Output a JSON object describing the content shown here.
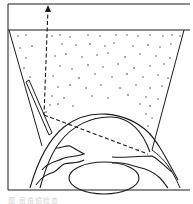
{
  "figure": {
    "colors": {
      "line": "#1a1a1a",
      "dots": "#333333",
      "background": "#ffffff",
      "caption": "#d6d6d6"
    },
    "elements": {
      "lens_top_rect": "top flat surface of goniolens",
      "lens_body": "trapezoidal lens body filled with stipple",
      "mirror": "angled mirror strip on left inner wall",
      "light_path": "dashed ray with arrowhead pointing up",
      "cornea": "curved cornea",
      "iris": "iris with pupil opening",
      "crystalline_lens": "oval crystalline lens",
      "sclera": "outer sclera walls"
    },
    "caption": "图   房角镜检查"
  }
}
